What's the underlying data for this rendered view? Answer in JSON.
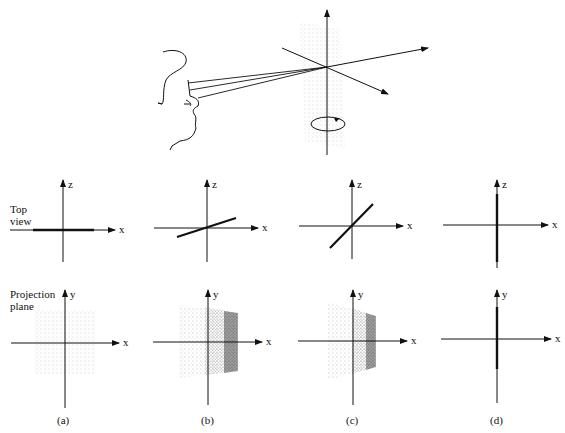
{
  "figure": {
    "row_labels": {
      "top": [
        "Top",
        "view"
      ],
      "bottom": [
        "Projection",
        "plane"
      ]
    },
    "axis_labels": {
      "horizontal": "x",
      "top_vertical": "z",
      "bottom_vertical": "y"
    },
    "panels": [
      {
        "caption": "(a)",
        "top_line_angle_deg": 0,
        "projection": "uniform square"
      },
      {
        "caption": "(b)",
        "top_line_angle_deg": 20,
        "projection": "trapezoid, dense right edge"
      },
      {
        "caption": "(c)",
        "top_line_angle_deg": 50,
        "projection": "narrower trapezoid, dense right edge"
      },
      {
        "caption": "(d)",
        "top_line_angle_deg": 90,
        "projection": "vertical line"
      }
    ],
    "illustration": "observer viewing rotating dotted plane about vertical axis"
  },
  "colors": {
    "ink": "#111111",
    "dots": "#555555",
    "background": "#ffffff"
  }
}
